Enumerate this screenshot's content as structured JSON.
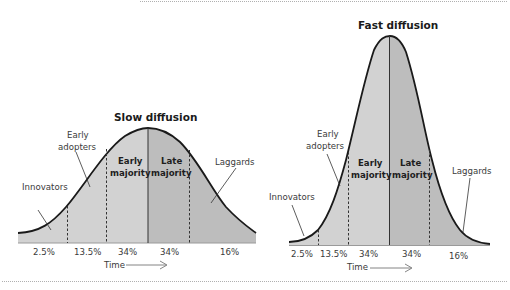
{
  "colors": {
    "fill_light": "#d2d2d2",
    "fill_dark": "#bdbdbd",
    "curve": "#1a1a1a",
    "text": "#3a3a3a",
    "rule": "#b0b0b0"
  },
  "slow": {
    "title": "Slow diffusion",
    "labels": {
      "innovators": "Innovators",
      "early_adopters_1": "Early",
      "early_adopters_2": "adopters",
      "early_majority_1": "Early",
      "early_majority_2": "majority",
      "late_majority_1": "Late",
      "late_majority_2": "majority",
      "laggards": "Laggards"
    },
    "percentages": [
      "2.5%",
      "13.5%",
      "34%",
      "34%",
      "16%"
    ],
    "axis_label": "Time"
  },
  "fast": {
    "title": "Fast diffusion",
    "labels": {
      "innovators": "Innovators",
      "early_adopters_1": "Early",
      "early_adopters_2": "adopters",
      "early_majority_1": "Early",
      "early_majority_2": "majority",
      "late_majority_1": "Late",
      "late_majority_2": "majority",
      "laggards": "Laggards"
    },
    "percentages": [
      "2.5%",
      "13.5%",
      "34%",
      "34%",
      "16%"
    ],
    "axis_label": "Time"
  }
}
